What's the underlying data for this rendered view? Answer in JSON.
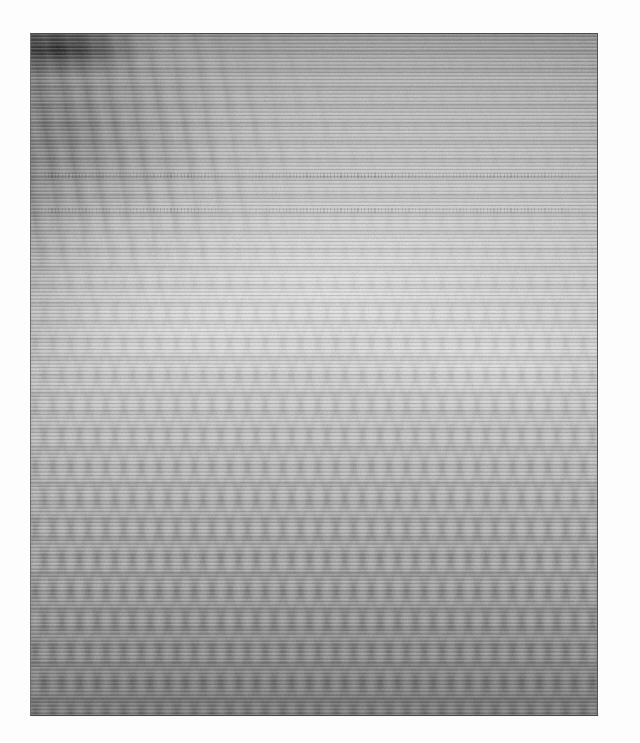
{
  "image": {
    "kind": "degraded-grayscale-scan",
    "description": "Heavily degraded low-quality grayscale scan dominated by horizontal scan-line streaking and chevron moire interference. No legible text or interface elements are present.",
    "width": 640,
    "height": 743,
    "canvas_background": "#fdfdfd"
  },
  "panel": {
    "left": 30,
    "top": 33,
    "width": 568,
    "height": 683,
    "border_color": "#4a4a4a",
    "base_color": "#b9b9b9"
  },
  "tones": {
    "top_edge": "#8d8d8d",
    "upper_mid": "#c7c7c7",
    "brightest_band": "#dadada",
    "lower_mid": "#b4b4b4",
    "bottom_edge": "#8a8a8a",
    "dark_corner_blob": "#121212"
  },
  "artifacts": {
    "scanlines": "horizontal-scan-lines",
    "moire": "chevron-zigzag-moire",
    "smear": "upper-left-diagonal-smear",
    "grain": "film-grain-noise"
  },
  "text_bands": [
    {
      "label": "illegible-text-row-1",
      "y": 172,
      "legible": "no"
    },
    {
      "label": "illegible-text-row-2",
      "y": 207,
      "legible": "no"
    }
  ],
  "accessibility": {
    "alt": "Degraded grayscale scanned image with heavy horizontal streaking and moire interference; contents are not legible."
  }
}
